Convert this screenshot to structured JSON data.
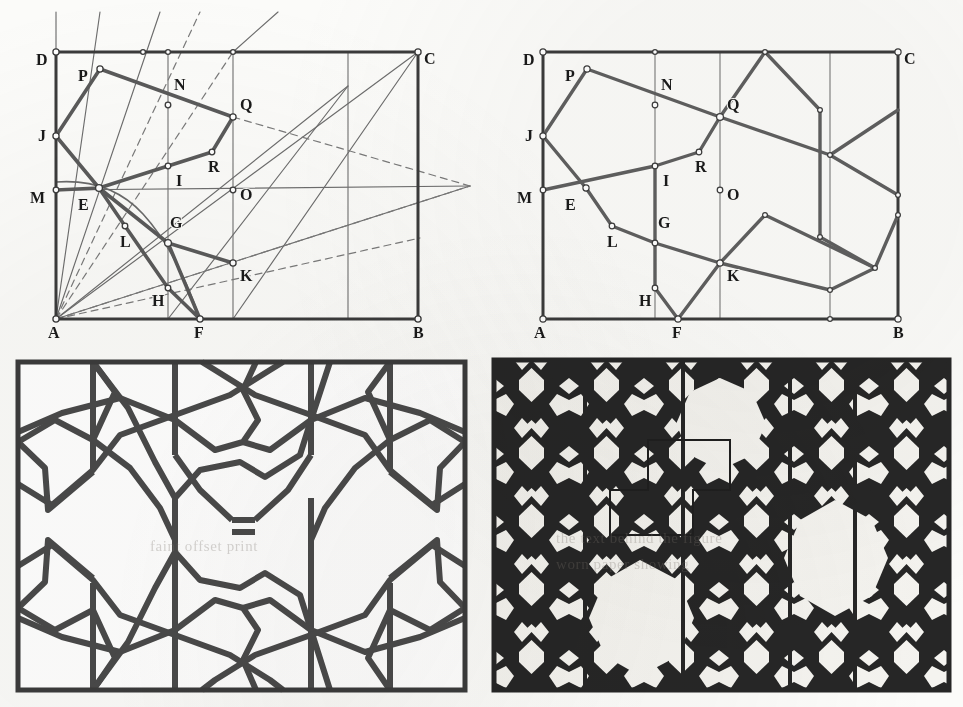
{
  "figure": {
    "panel_count": 4,
    "ink_color": "#4a4a4a",
    "heavy_color": "#555555",
    "frame_color": "#3b3b3b",
    "fill_color": "#262626",
    "paper_color": "#fbfbf9"
  },
  "panels": {
    "top_left": {
      "name": "construction-lines-panel",
      "caption": "",
      "frame": {
        "A": [
          56,
          319
        ],
        "B": [
          418,
          319
        ],
        "C": [
          418,
          52
        ],
        "D": [
          56,
          52
        ]
      },
      "labels": [
        {
          "id": "A",
          "text": "A",
          "x": 48,
          "y": 338
        },
        {
          "id": "B",
          "text": "B",
          "x": 418,
          "y": 338
        },
        {
          "id": "C",
          "text": "C",
          "x": 424,
          "y": 64
        },
        {
          "id": "D",
          "text": "D",
          "x": 40,
          "y": 65
        },
        {
          "id": "E",
          "text": "E",
          "x": 78,
          "y": 208
        },
        {
          "id": "F",
          "text": "F",
          "x": 190,
          "y": 338
        },
        {
          "id": "G",
          "text": "G",
          "x": 172,
          "y": 226
        },
        {
          "id": "H",
          "text": "H",
          "x": 157,
          "y": 303
        },
        {
          "id": "I",
          "text": "I",
          "x": 178,
          "y": 185
        },
        {
          "id": "J",
          "text": "J",
          "x": 42,
          "y": 137
        },
        {
          "id": "K",
          "text": "K",
          "x": 245,
          "y": 272
        },
        {
          "id": "L",
          "text": "L",
          "x": 126,
          "y": 245
        },
        {
          "id": "M",
          "text": "M",
          "x": 35,
          "y": 202
        },
        {
          "id": "N",
          "text": "N",
          "x": 178,
          "y": 87
        },
        {
          "id": "O",
          "text": "O",
          "x": 245,
          "y": 196
        },
        {
          "id": "P",
          "text": "P",
          "x": 80,
          "y": 80
        },
        {
          "id": "Q",
          "text": "Q",
          "x": 243,
          "y": 105
        },
        {
          "id": "R",
          "text": "R",
          "x": 212,
          "y": 170
        }
      ],
      "points": {
        "A": [
          56,
          319
        ],
        "B": [
          418,
          319
        ],
        "C": [
          418,
          52
        ],
        "D": [
          56,
          52
        ],
        "E": [
          99,
          188
        ],
        "F": [
          200,
          319
        ],
        "G": [
          168,
          243
        ],
        "H": [
          168,
          288
        ],
        "I": [
          168,
          166
        ],
        "J": [
          56,
          136
        ],
        "K": [
          233,
          263
        ],
        "L": [
          125,
          226
        ],
        "M": [
          56,
          190
        ],
        "N": [
          168,
          105
        ],
        "O": [
          233,
          190
        ],
        "P": [
          100,
          69
        ],
        "Q": [
          233,
          117
        ],
        "R": [
          212,
          152
        ],
        "T1": [
          168,
          52
        ],
        "T2": [
          143,
          52
        ],
        "T3": [
          233,
          52
        ],
        "T4": [
          348,
          86
        ],
        "T5": [
          418,
          194
        ],
        "T6": [
          340,
          52
        ]
      },
      "heavy_polyline_1": [
        "J",
        "P",
        "Q",
        "R",
        "I",
        "E",
        "J"
      ],
      "heavy_polyline_2": [
        "M",
        "E",
        "G",
        "K"
      ],
      "heavy_polyline_3": [
        "E",
        "L",
        "H",
        "F",
        "G"
      ],
      "thin_rays_from_A": [
        "D",
        "T2",
        "T1",
        "T6",
        "C",
        "T5"
      ],
      "dashed_rays_from_A": [
        "T3",
        "K",
        "T5"
      ]
    },
    "top_right": {
      "name": "resolved-pattern-panel",
      "frame": {
        "A": [
          543,
          319
        ],
        "B": [
          898,
          319
        ],
        "C": [
          898,
          52
        ],
        "D": [
          543,
          52
        ]
      },
      "labels": [
        {
          "id": "A",
          "text": "A",
          "x": 534,
          "y": 338
        },
        {
          "id": "B",
          "text": "B",
          "x": 898,
          "y": 338
        },
        {
          "id": "C",
          "text": "C",
          "x": 904,
          "y": 64
        },
        {
          "id": "D",
          "text": "D",
          "x": 527,
          "y": 65
        },
        {
          "id": "E",
          "text": "E",
          "x": 565,
          "y": 208
        },
        {
          "id": "F",
          "text": "F",
          "x": 678,
          "y": 338
        },
        {
          "id": "G",
          "text": "G",
          "x": 660,
          "y": 226
        },
        {
          "id": "H",
          "text": "H",
          "x": 644,
          "y": 303
        },
        {
          "id": "I",
          "text": "I",
          "x": 665,
          "y": 185
        },
        {
          "id": "J",
          "text": "J",
          "x": 529,
          "y": 137
        },
        {
          "id": "K",
          "text": "K",
          "x": 731,
          "y": 272
        },
        {
          "id": "L",
          "text": "L",
          "x": 613,
          "y": 245
        },
        {
          "id": "M",
          "text": "M",
          "x": 522,
          "y": 202
        },
        {
          "id": "N",
          "text": "N",
          "x": 665,
          "y": 87
        },
        {
          "id": "O",
          "text": "O",
          "x": 731,
          "y": 196
        },
        {
          "id": "P",
          "text": "P",
          "x": 567,
          "y": 80
        },
        {
          "id": "Q",
          "text": "Q",
          "x": 730,
          "y": 105
        },
        {
          "id": "R",
          "text": "R",
          "x": 699,
          "y": 170
        }
      ],
      "points": {
        "A": [
          543,
          319
        ],
        "B": [
          898,
          319
        ],
        "C": [
          898,
          52
        ],
        "D": [
          543,
          52
        ],
        "E": [
          586,
          188
        ],
        "F": [
          678,
          319
        ],
        "G": [
          655,
          243
        ],
        "H": [
          655,
          288
        ],
        "I": [
          655,
          166
        ],
        "J": [
          543,
          136
        ],
        "K": [
          720,
          263
        ],
        "L": [
          612,
          226
        ],
        "M": [
          543,
          190
        ],
        "N": [
          655,
          105
        ],
        "O": [
          720,
          190
        ],
        "P": [
          587,
          69
        ],
        "Q": [
          720,
          117
        ],
        "R": [
          699,
          152
        ]
      }
    },
    "bottom_left": {
      "name": "line-tessellation-panel",
      "frame": [
        18,
        362,
        447,
        328
      ]
    },
    "bottom_right": {
      "name": "filled-tessellation-panel",
      "frame": [
        494,
        360,
        455,
        330
      ],
      "highlight_rect": {
        "x": 610,
        "y": 440,
        "w": 120,
        "h": 95
      }
    }
  },
  "ghost_text": [
    {
      "text": "the text behind the figure",
      "x": 556,
      "y": 540
    },
    {
      "text": "worn paper showing",
      "x": 556,
      "y": 565
    },
    {
      "text": "faint offset print",
      "x": 150,
      "y": 545
    }
  ]
}
